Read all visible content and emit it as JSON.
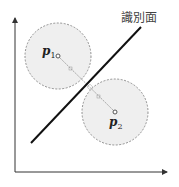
{
  "diagram": {
    "plane_label": "識別面",
    "points": [
      {
        "name": "p",
        "sub": "1",
        "cx": 58,
        "cy": 56,
        "r": 33
      },
      {
        "name": "p",
        "sub": "2",
        "cx": 115,
        "cy": 112,
        "r": 33
      }
    ],
    "colors": {
      "circle_fill": "#efefef",
      "circle_stroke": "#777777",
      "line": "#111111",
      "axis": "#333333"
    }
  }
}
